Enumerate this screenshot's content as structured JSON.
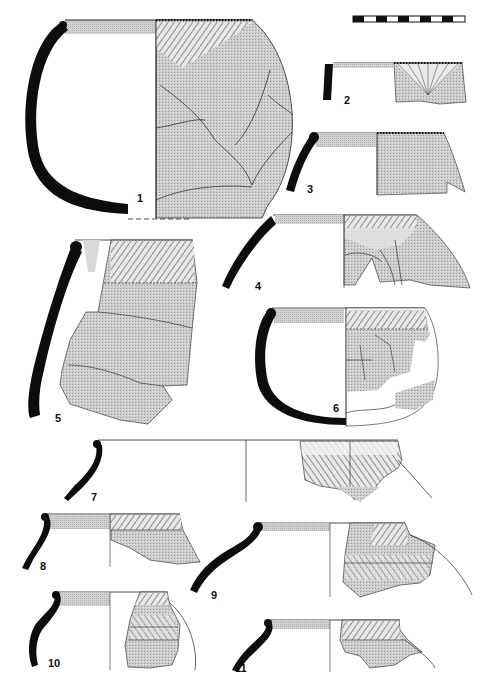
{
  "plate": {
    "type": "archaeological pottery drawing plate",
    "scale_bar": {
      "segments": 10,
      "pattern": "alternating black and white"
    },
    "colors": {
      "section": "#0d0d0d",
      "surface_tone": "#c9c9c9",
      "rim_band": "#d4d4d4",
      "line": "#222222",
      "background": "#ffffff"
    },
    "vessels": [
      {
        "number": "1",
        "label": "1",
        "description": "globular pot, full profile, hatched shoulder decoration with crack lines"
      },
      {
        "number": "2",
        "label": "2",
        "description": "rim sherd with radiating incised lines"
      },
      {
        "number": "3",
        "label": "3",
        "description": "rim sherd with notched lip and dotted shoulder"
      },
      {
        "number": "4",
        "label": "4",
        "description": "rim and shoulder with hatched band"
      },
      {
        "number": "5",
        "label": "5",
        "description": "tall sherd with hatched rim zone"
      },
      {
        "number": "6",
        "label": "6",
        "description": "bowl with hatched band, partial reconstruction"
      },
      {
        "number": "7",
        "label": "7",
        "description": "wide rim sherd with diagonal hatching"
      },
      {
        "number": "8",
        "label": "8",
        "description": "rim sherd with herringbone band"
      },
      {
        "number": "9",
        "label": "9",
        "description": "rim and shoulder with chevron bands"
      },
      {
        "number": "10",
        "label": "10",
        "description": "rim sherd with chevron bands"
      },
      {
        "number": "11",
        "label": "11",
        "description": "rim sherd with herringbone decoration"
      }
    ]
  }
}
